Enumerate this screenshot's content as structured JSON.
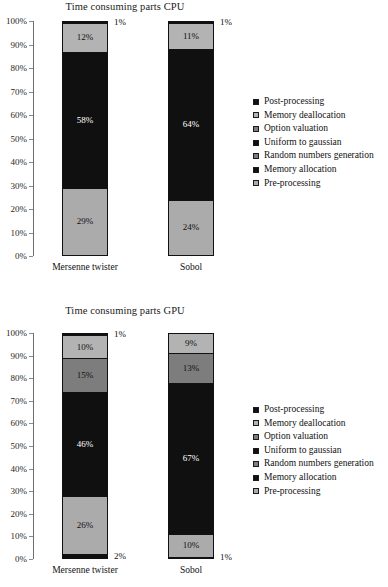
{
  "palette": {
    "post_processing": "#101010",
    "memory_deallocation": "#b3b3b3",
    "option_valuation": "#7d7d7d",
    "uniform_to_gaussian": "#101010",
    "random_numbers_generation": "#7d7d7d",
    "memory_allocation": "#101010",
    "pre_processing": "#ababab",
    "axis": "#6e6e6e",
    "outline": "#111111",
    "background": "#ffffff"
  },
  "legend": {
    "entries": [
      {
        "label": "Post-processing",
        "color": "#101010"
      },
      {
        "label": "Memory deallocation",
        "color": "#b3b3b3"
      },
      {
        "label": "Option valuation",
        "color": "#7d7d7d"
      },
      {
        "label": "Uniform to gaussian",
        "color": "#101010"
      },
      {
        "label": "Random numbers generation",
        "color": "#7d7d7d"
      },
      {
        "label": "Memory allocation",
        "color": "#101010"
      },
      {
        "label": "Pre-processing",
        "color": "#ababab"
      }
    ]
  },
  "axis_ticks": [
    "100%",
    "90%",
    "80%",
    "70%",
    "60%",
    "50%",
    "40%",
    "30%",
    "20%",
    "10%",
    "0%"
  ],
  "chart_data": [
    {
      "id": "cpu",
      "type": "bar",
      "stacked": true,
      "normalized": "100%",
      "title": "Time consuming parts CPU",
      "xlabel": "",
      "ylabel": "",
      "ylim": [
        0,
        100
      ],
      "ytick_labels": [
        "0%",
        "10%",
        "20%",
        "30%",
        "40%",
        "50%",
        "60%",
        "70%",
        "80%",
        "90%",
        "100%"
      ],
      "grid": false,
      "legend_position": "right",
      "categories": [
        "Mersenne twister",
        "Sobol"
      ],
      "series": [
        {
          "name": "Pre-processing",
          "color": "#ababab",
          "values": [
            29,
            24
          ],
          "labels": [
            "29%",
            "24%"
          ],
          "label_inside": [
            true,
            true
          ]
        },
        {
          "name": "Memory allocation",
          "color": "#101010",
          "values": [
            0,
            0
          ],
          "labels": [
            "",
            ""
          ],
          "label_inside": [
            true,
            true
          ]
        },
        {
          "name": "Random numbers generation",
          "color": "#7d7d7d",
          "values": [
            0,
            0
          ],
          "labels": [
            "",
            ""
          ],
          "label_inside": [
            true,
            true
          ]
        },
        {
          "name": "Uniform to gaussian",
          "color": "#101010",
          "values": [
            58,
            64
          ],
          "labels": [
            "58%",
            "64%"
          ],
          "label_inside": [
            true,
            true
          ]
        },
        {
          "name": "Option valuation",
          "color": "#7d7d7d",
          "values": [
            0,
            0
          ],
          "labels": [
            "",
            ""
          ],
          "label_inside": [
            true,
            true
          ]
        },
        {
          "name": "Memory deallocation",
          "color": "#b3b3b3",
          "values": [
            12,
            11
          ],
          "labels": [
            "12%",
            "11%"
          ],
          "label_inside": [
            true,
            true
          ]
        },
        {
          "name": "Post-processing",
          "color": "#101010",
          "values": [
            1,
            1
          ],
          "labels": [
            "1%",
            "1%"
          ],
          "label_inside": [
            false,
            false
          ]
        }
      ]
    },
    {
      "id": "gpu",
      "type": "bar",
      "stacked": true,
      "normalized": "100%",
      "title": "Time consuming parts GPU",
      "xlabel": "",
      "ylabel": "",
      "ylim": [
        0,
        100
      ],
      "ytick_labels": [
        "0%",
        "10%",
        "20%",
        "30%",
        "40%",
        "50%",
        "60%",
        "70%",
        "80%",
        "90%",
        "100%"
      ],
      "grid": false,
      "legend_position": "right",
      "categories": [
        "Mersenne twister",
        "Sobol"
      ],
      "series": [
        {
          "name": "Pre-processing",
          "color": "#101010",
          "values": [
            2,
            1
          ],
          "labels": [
            "2%",
            "1%"
          ],
          "label_inside": [
            false,
            false
          ]
        },
        {
          "name": "Memory allocation",
          "color": "#ababab",
          "values": [
            26,
            10
          ],
          "labels": [
            "26%",
            "10%"
          ],
          "label_inside": [
            true,
            true
          ]
        },
        {
          "name": "Random numbers generation",
          "color": "#101010",
          "values": [
            46,
            67
          ],
          "labels": [
            "46%",
            "67%"
          ],
          "label_inside": [
            true,
            true
          ]
        },
        {
          "name": "Uniform to gaussian",
          "color": "#7d7d7d",
          "values": [
            15,
            13
          ],
          "labels": [
            "15%",
            "13%"
          ],
          "label_inside": [
            true,
            true
          ]
        },
        {
          "name": "Option valuation",
          "color": "#b3b3b3",
          "values": [
            10,
            9
          ],
          "labels": [
            "10%",
            "9%"
          ],
          "label_inside": [
            true,
            true
          ]
        },
        {
          "name": "Memory deallocation",
          "color": "#101010",
          "values": [
            1,
            0
          ],
          "labels": [
            "1%",
            ""
          ],
          "label_inside": [
            false,
            false
          ]
        },
        {
          "name": "Post-processing",
          "color": "#101010",
          "values": [
            0,
            0
          ],
          "labels": [
            "",
            ""
          ],
          "label_inside": [
            false,
            false
          ]
        }
      ]
    }
  ]
}
